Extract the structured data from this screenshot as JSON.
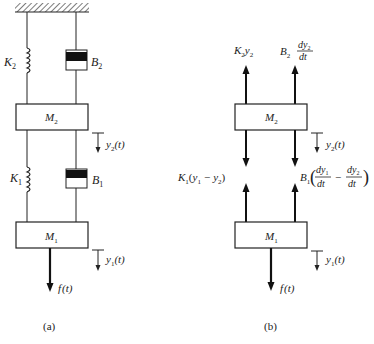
{
  "diagram": {
    "type": "mechanical two-mass spring-damper system and free-body diagram",
    "panel_a": {
      "caption": "(a)",
      "ground": "fixed support (hatched)",
      "spring_top": "K2",
      "damper_top": "B2",
      "mass_top": "M2",
      "disp_top": "y2(t)",
      "spring_bottom": "K1",
      "damper_bottom": "B1",
      "mass_bottom": "M1",
      "disp_bottom": "y1(t)",
      "force": "f(t)"
    },
    "panel_b": {
      "caption": "(b)",
      "force_K2": "K2y2",
      "force_B2": "B2 dy2/dt",
      "mass_top": "M2",
      "disp_top": "y2(t)",
      "force_K1": "K1(y1 − y2)",
      "force_B1": "B1(dy1/dt − dy2/dt)",
      "mass_bottom": "M1",
      "disp_bottom": "y1(t)",
      "force": "f(t)"
    }
  },
  "text": {
    "a_caption": "(a)",
    "b_caption": "(b)",
    "K": "K",
    "B": "B",
    "M": "M",
    "y": "y",
    "f": "f",
    "t_paren": "(t)",
    "sub1": "1",
    "sub2": "2",
    "dy": "dy",
    "dt": "dt",
    "minus": "−",
    "lparen": "(",
    "rparen": ")"
  }
}
